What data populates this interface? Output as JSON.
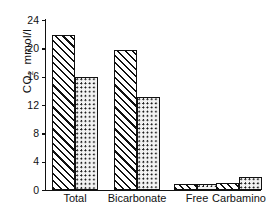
{
  "chart_data": {
    "type": "bar",
    "title": "",
    "xlabel": "",
    "ylabel": "CO2 mmol/l",
    "ylabel_parts": {
      "prefix": "CO",
      "subscript": "2",
      "unit": "mmol/l"
    },
    "ylim": [
      0,
      24
    ],
    "yticks": [
      0,
      4,
      8,
      12,
      16,
      20,
      24
    ],
    "ytick_labels": [
      "0",
      "4",
      "8",
      "12",
      "16",
      "20",
      "24"
    ],
    "grid": false,
    "legend": "none",
    "categories": [
      "Total",
      "Bicarbonate",
      "Free",
      "Carbamino"
    ],
    "series": [
      {
        "name": "hatched",
        "pattern": "diagonal-hatch",
        "values": [
          21.9,
          19.7,
          0.8,
          1.0
        ]
      },
      {
        "name": "stippled",
        "pattern": "dotted",
        "values": [
          15.9,
          13.2,
          0.8,
          1.8
        ]
      }
    ],
    "axis_color": "#111111",
    "bar_edge_color": "#111111",
    "bar_fill_color": "#ffffff"
  }
}
